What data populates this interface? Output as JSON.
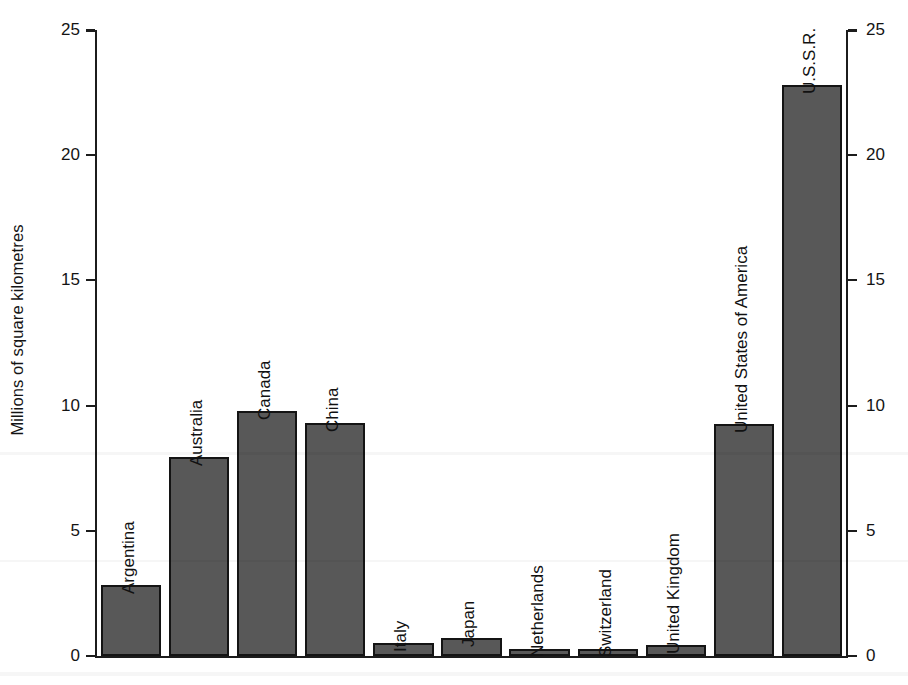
{
  "chart_data": {
    "type": "bar",
    "title": "",
    "xlabel": "",
    "ylabel": "Millions of square kilometres",
    "ylim": [
      0,
      25
    ],
    "yticks": [
      0,
      5,
      10,
      15,
      20,
      25
    ],
    "ytick_labels": [
      "0",
      "5",
      "10",
      "15",
      "20",
      "25"
    ],
    "right_axis_labels": [
      "0",
      "5",
      "10",
      "15",
      "20",
      "25"
    ],
    "grid": false,
    "legend": "none",
    "bar_color": "#585858",
    "bar_edge_color": "#141414",
    "axis_color": "#1c1c1c",
    "categories": [
      "Argentina",
      "Australia",
      "Canada",
      "China",
      "Italy",
      "Japan",
      "Netherlands",
      "Switzerland",
      "United Kingdom",
      "United States of America",
      "U.S.S.R."
    ],
    "values": [
      2.85,
      7.95,
      9.8,
      9.3,
      0.5,
      0.7,
      0.3,
      0.3,
      0.45,
      9.25,
      22.8
    ],
    "value_unit": "millions of square kilometres",
    "label_orientation": "vertical-rotated-90",
    "annotations": []
  },
  "axis": {
    "y_title": "Millions of square kilometres"
  }
}
